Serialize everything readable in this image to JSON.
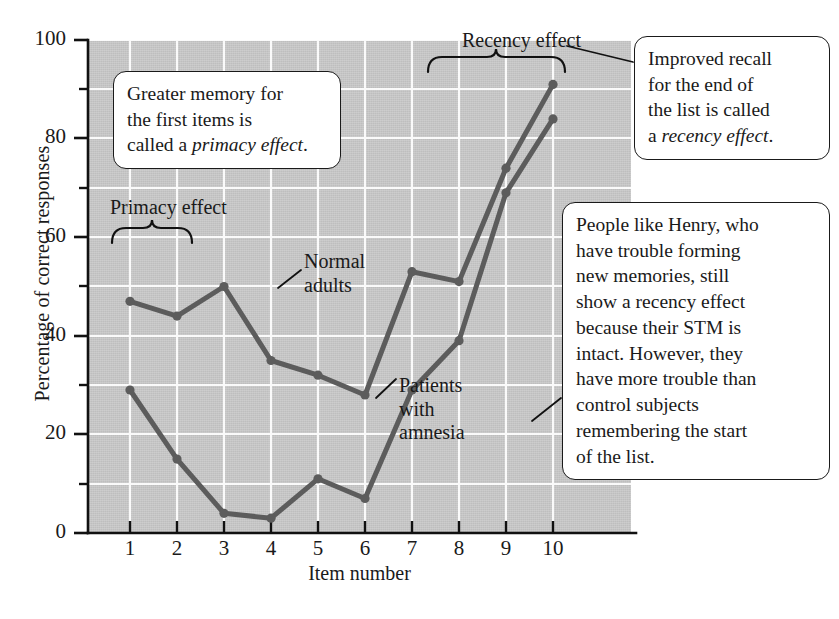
{
  "chart_data": {
    "type": "line",
    "title": "",
    "xlabel": "Item number",
    "ylabel": "Percentage of correct responses",
    "categories": [
      1,
      2,
      3,
      4,
      5,
      6,
      7,
      8,
      9,
      10
    ],
    "x_tick_labels": [
      "1",
      "2",
      "3",
      "4",
      "5",
      "6",
      "7",
      "8",
      "9",
      "10"
    ],
    "y_tick_labels": [
      "0",
      "20",
      "40",
      "60",
      "80",
      "100"
    ],
    "y_tick_values": [
      0,
      20,
      40,
      60,
      80,
      100
    ],
    "y_minor_tick_values": [
      10,
      30,
      50,
      70,
      90
    ],
    "xlim": [
      0.5,
      10.5
    ],
    "ylim": [
      0,
      100
    ],
    "grid": true,
    "grid_color": "#ffffff",
    "plot_background": "#c9c9c9",
    "series_color": "#5c5c5c",
    "legend": "inline-annotations",
    "series": [
      {
        "name": "Normal adults",
        "values": [
          47,
          44,
          50,
          35,
          32,
          28,
          53,
          51,
          74,
          91
        ]
      },
      {
        "name": "Patients with amnesia",
        "values": [
          29,
          15,
          4,
          3,
          11,
          7,
          29,
          39,
          69,
          84
        ]
      }
    ]
  },
  "annotations": {
    "primacy_brace_label": "Primacy effect",
    "recency_brace_label": "Recency effect",
    "normal_adults_label_line1": "Normal",
    "normal_adults_label_line2": "adults",
    "patients_label_line1": "Patients",
    "patients_label_line2": "with",
    "patients_label_line3": "amnesia"
  },
  "callouts": {
    "primacy": {
      "text_plain": "Greater memory for the first items is called a primacy effect.",
      "line1": "Greater memory for",
      "line2": "the first items is",
      "line3_prefix": "called a ",
      "line3_italic": "primacy effect",
      "line3_suffix": "."
    },
    "recency": {
      "text_plain": "Improved recall for the end of the list is called a recency effect.",
      "line1": "Improved recall",
      "line2": "for the end of",
      "line3": "the list is called",
      "line4_prefix": "a ",
      "line4_italic": "recency effect",
      "line4_suffix": "."
    },
    "henry": {
      "text_plain": "People like Henry, who have trouble forming new memories, still show a recency effect because their STM is intact. However, they have more trouble than control subjects remembering the start of the list.",
      "line1": "People like Henry, who",
      "line2": "have trouble forming",
      "line3": "new memories, still",
      "line4": "show a recency effect",
      "line5": "because their STM is",
      "line6": "intact. However, they",
      "line7": "have more trouble than",
      "line8": "control subjects",
      "line9": "remembering the start",
      "line10": "of the list."
    }
  }
}
